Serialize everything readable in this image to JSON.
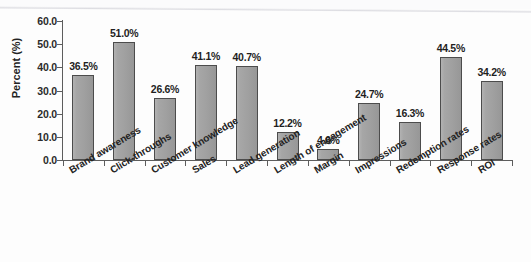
{
  "chart_data": {
    "type": "bar",
    "title": "",
    "subtitle": "",
    "xlabel": "",
    "ylabel": "Percent (%)",
    "ylim": [
      0,
      60
    ],
    "ytick_labels": [
      "60.0",
      "50.0",
      "40.0",
      "30.0",
      "20.0",
      "10.0",
      "0.0"
    ],
    "ytick_values": [
      60,
      50,
      40,
      30,
      20,
      10,
      0
    ],
    "grid": false,
    "legend": null,
    "value_label_suffix": "%",
    "categories": [
      "Brand awareness",
      "Click-throughs",
      "Customer knowledge",
      "Sales",
      "Lead generation",
      "Length of engagement",
      "Margin",
      "Impressions",
      "Redemption rates",
      "Response rates",
      "ROI"
    ],
    "values": [
      36.5,
      51.0,
      26.6,
      41.1,
      40.7,
      12.2,
      4.6,
      24.7,
      16.3,
      44.5,
      34.2
    ],
    "value_labels": [
      "36.5%",
      "51.0%",
      "26.6%",
      "41.1%",
      "40.7%",
      "12.2%",
      "4.6%",
      "24.7%",
      "16.3%",
      "44.5%",
      "34.2%"
    ],
    "bar_color": "#a0a0a0",
    "bar_outline_color": "#4c4c4c",
    "axis_color": "#5d5d5d",
    "background_color": "#fdfdfd",
    "text_color": "#232323"
  }
}
